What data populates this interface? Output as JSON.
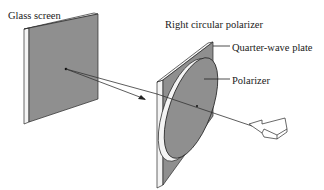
{
  "labels": {
    "glass_screen": "Glass screen",
    "right_circular_polarizer": "Right circular polarizer",
    "quarter_wave_plate": "Quarter-wave plate",
    "polarizer": "Polarizer"
  },
  "colors": {
    "plate_fill": "#8f8f8f",
    "plate_edge": "#f4f4f4",
    "outline": "#2a2a2a",
    "ray": "#333333",
    "background": "#ffffff"
  }
}
